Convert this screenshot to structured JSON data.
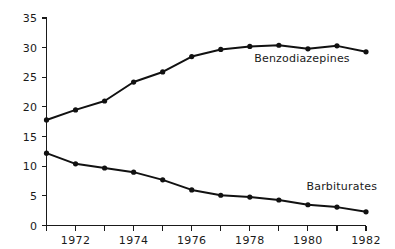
{
  "chart_data": {
    "type": "line",
    "title": "",
    "subtitle": "",
    "xlabel": "",
    "ylabel": "",
    "xlim": [
      1971,
      1982
    ],
    "ylim": [
      0,
      35
    ],
    "grid": false,
    "legend_position": "inline-right-of-series",
    "x": [
      1971,
      1972,
      1973,
      1974,
      1975,
      1976,
      1977,
      1978,
      1979,
      1980,
      1981,
      1982
    ],
    "x_tick_labels": [
      "",
      "1972",
      "",
      "1974",
      "",
      "1976",
      "",
      "1978",
      "",
      "1980",
      "",
      "1982"
    ],
    "y_ticks": [
      0,
      5,
      10,
      15,
      20,
      25,
      30,
      35
    ],
    "y_tick_labels": [
      "0",
      "5",
      "10",
      "15",
      "20",
      "25",
      "30",
      "35"
    ],
    "series": [
      {
        "name": "Benzodiazepines",
        "label": "Benzodiazepines",
        "color": "#111111",
        "marker": "filled-circle",
        "values": [
          17.8,
          19.5,
          21.0,
          24.2,
          25.9,
          28.5,
          29.7,
          30.2,
          30.4,
          29.8,
          30.3,
          29.3
        ]
      },
      {
        "name": "Barbiturates",
        "label": "Barbiturates",
        "color": "#111111",
        "marker": "filled-circle",
        "values": [
          12.2,
          10.4,
          9.7,
          9.0,
          7.7,
          6.0,
          5.1,
          4.8,
          4.3,
          3.5,
          3.1,
          2.3
        ]
      }
    ],
    "annotations": [
      {
        "text": "Benzodiazepines",
        "x": 1978.15,
        "y": 27.5
      },
      {
        "text": "Barbiturates",
        "x": 1979.95,
        "y": 6.0
      }
    ]
  },
  "axes": {
    "y_axis_name": "value-axis",
    "x_axis_name": "year-axis"
  }
}
